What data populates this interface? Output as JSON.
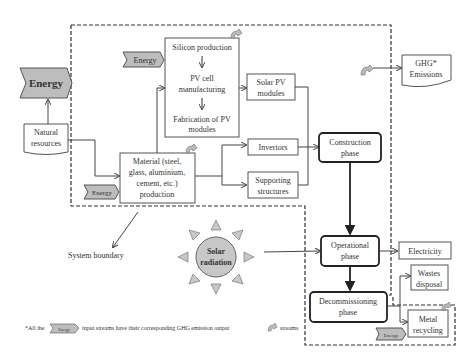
{
  "diagram": {
    "energy_main": "Energy",
    "natural_resources": [
      "Natural",
      "resources"
    ],
    "energy_silicon": "Energy",
    "energy_material": "Energy",
    "energy_recycling": "Energy",
    "silicon_production": "Silicon production",
    "pv_cell": [
      "PV cell",
      "manufacturing"
    ],
    "fabrication": [
      "Fabrication of PV",
      "modules"
    ],
    "material": [
      "Material (steel,",
      "glass, aluminium,",
      "cement, etc.)",
      "production"
    ],
    "solar_pv": [
      "Solar PV",
      "modules"
    ],
    "invertors": "Invertors",
    "supporting": [
      "Supporting",
      "structures"
    ],
    "construction": [
      "Construction",
      "phase"
    ],
    "operational": [
      "Operational",
      "phase"
    ],
    "decommissioning": [
      "Decommissioning",
      "phase"
    ],
    "ghg": [
      "GHG*",
      "Emissions"
    ],
    "electricity": "Electricity",
    "wastes": [
      "Wastes",
      "disposal"
    ],
    "metal": [
      "Metal",
      "recycling"
    ],
    "solar_radiation": [
      "Solar",
      "radiation"
    ],
    "system_boundary": "System boundary",
    "footnote": {
      "prefix": "*All the",
      "energy": "Energy",
      "middle": "input streams have their corresponding GHG emission output",
      "suffix": "streams"
    }
  }
}
